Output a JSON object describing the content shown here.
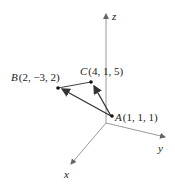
{
  "diagram": {
    "axes": {
      "x": {
        "label": "x"
      },
      "y": {
        "label": "y"
      },
      "z": {
        "label": "z"
      }
    },
    "points": {
      "A": {
        "name": "A",
        "coords": "(1, 1, 1)"
      },
      "B": {
        "name": "B",
        "coords": "(2, −3, 2)"
      },
      "C": {
        "name": "C",
        "coords": "(4, 1, 5)"
      }
    },
    "vectors": [
      "AB",
      "AC"
    ],
    "segments": [
      "BC"
    ],
    "colors": {
      "axis": "#888888",
      "vector": "#333333",
      "text": "#222222"
    }
  }
}
